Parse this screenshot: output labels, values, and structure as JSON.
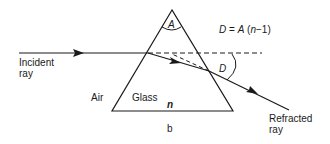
{
  "diagram": {
    "formula": "D = A (n−1)",
    "apex_angle_label": "A",
    "deviation_label": "D",
    "incident_label_line1": "Incident",
    "incident_label_line2": "ray",
    "refracted_label_line1": "Refracted",
    "refracted_label_line2": "ray",
    "medium_outside": "Air",
    "medium_inside": "Glass",
    "refractive_index": "n",
    "caption": "b",
    "colors": {
      "line": "#1a1a1a",
      "background": "#ffffff"
    }
  }
}
